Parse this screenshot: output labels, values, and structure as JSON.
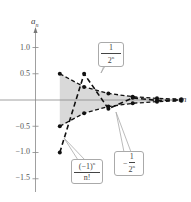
{
  "chart_data": {
    "type": "line",
    "title": "",
    "xlabel": "n",
    "ylabel": "a_n",
    "ylim": [
      -1.7,
      1.3
    ],
    "yticks": [
      1.0,
      0.5,
      -0.5,
      -1.0,
      -1.5
    ],
    "ytick_labels": [
      "1.0",
      "0.5",
      "−0.5",
      "−1.0",
      "−1.5"
    ],
    "grid": false,
    "legend": "callouts",
    "x": [
      1,
      2,
      3,
      4,
      5,
      6
    ],
    "shaded_region": "between 1/2^n and -1/2^n",
    "series": [
      {
        "name": "1/2^n",
        "style": "dashed",
        "values": [
          0.5,
          0.25,
          0.125,
          0.0625,
          0.03125,
          0.015625
        ]
      },
      {
        "name": "-1/2^n",
        "style": "dashed",
        "values": [
          -0.5,
          -0.25,
          -0.125,
          -0.0625,
          -0.03125,
          -0.015625
        ]
      },
      {
        "name": "(-1)^n/n!",
        "style": "dashed",
        "values": [
          -1.0,
          0.5,
          -0.1667,
          0.0417,
          -0.0083,
          0.0014
        ]
      }
    ]
  },
  "labels": {
    "y_axis": "a",
    "y_axis_sub": "n",
    "x_axis": "n",
    "ticks": [
      "1.0",
      "0.5",
      "−0.5",
      "−1.0",
      "−1.5"
    ],
    "callout_upper": {
      "num": "1",
      "den": "2",
      "den_sup": "n"
    },
    "callout_lower": {
      "sign": "−",
      "num": "1",
      "den": "2",
      "den_sup": "n"
    },
    "callout_seq": {
      "num": "(−1)",
      "num_sup": "n",
      "den": "n!"
    }
  }
}
